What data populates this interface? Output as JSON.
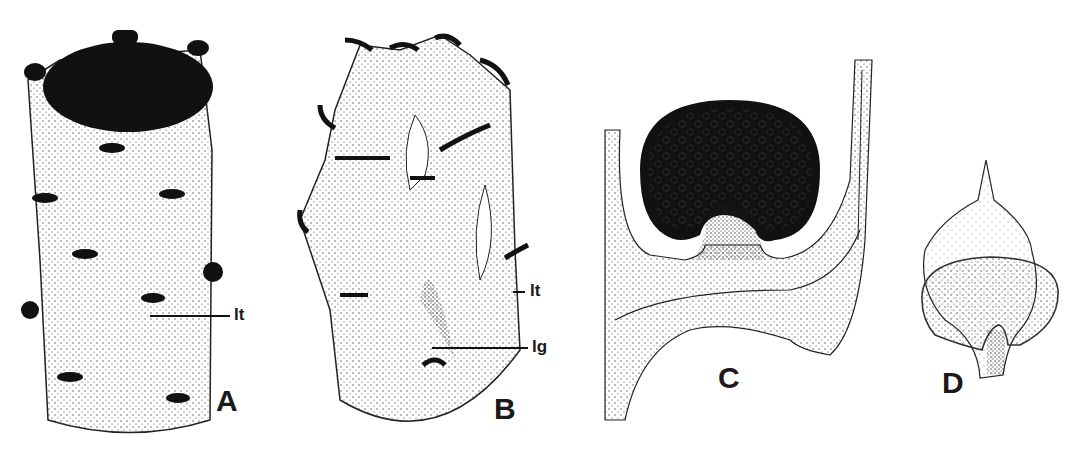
{
  "figure": {
    "panels": [
      {
        "id": "A",
        "label": "A",
        "annotations": [
          {
            "text": "lt"
          }
        ]
      },
      {
        "id": "B",
        "label": "B",
        "annotations": [
          {
            "text": "lt"
          },
          {
            "text": "lg"
          }
        ]
      },
      {
        "id": "C",
        "label": "C",
        "annotations": []
      },
      {
        "id": "D",
        "label": "D",
        "annotations": []
      }
    ],
    "colors": {
      "ink": "#1a1a1a",
      "paper": "#ffffff",
      "stipple": "#555555"
    }
  }
}
